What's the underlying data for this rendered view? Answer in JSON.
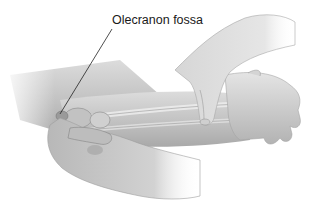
{
  "figure": {
    "labels": [
      {
        "text": "Olecranon fossa",
        "target": "olecranon-fossa"
      }
    ]
  },
  "colors": {
    "background": "#ffffff",
    "skin_light": "#e2e2e2",
    "skin_mid": "#bdbdbd",
    "skin_dark": "#8c8c8c",
    "bone": "#d8d8d8",
    "leader_line": "#222222",
    "label_text": "#1a1a1a"
  }
}
